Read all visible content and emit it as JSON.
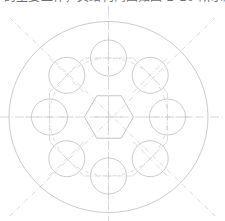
{
  "caption": {
    "text": "的主要工作，其结构简图如图 2-10 所示。",
    "note": "clipped-top-text"
  },
  "colors": {
    "outline": "#c2c2c2",
    "centerline": "#c9c9c9",
    "construction": "#cfcfcf",
    "hexagon": "#bdbdbd",
    "background": "#ffffff",
    "caption": "#6f6f6f"
  },
  "drawing": {
    "title": "flange-bolt-pattern",
    "center": {
      "x": 108.5,
      "y": 117.0
    },
    "outer_circle": {
      "cx": 108.5,
      "cy": 117.0,
      "rx": 99.5,
      "ry": 95.5
    },
    "bolt_circle": {
      "cx": 108.5,
      "cy": 117.0,
      "r": 59.0
    },
    "hexagon": {
      "cx": 109.0,
      "cy": 117.0,
      "r": 24.5,
      "orientation": "flat-top",
      "sides": 6
    },
    "hole_radius": 18.0,
    "hole_count": 8,
    "holes": [
      {
        "name": "hole-top",
        "angle": 90,
        "cx": 108.5,
        "cy": 58.0,
        "mark": "cross-orthogonal"
      },
      {
        "name": "hole-upper-right",
        "angle": 45,
        "cx": 150.2,
        "cy": 75.3,
        "mark": "cross-diagonal"
      },
      {
        "name": "hole-right",
        "angle": 0,
        "cx": 167.5,
        "cy": 117.0,
        "mark": "cross-orthogonal"
      },
      {
        "name": "hole-lower-right",
        "angle": 315,
        "cx": 150.2,
        "cy": 158.7,
        "mark": "cross-diagonal"
      },
      {
        "name": "hole-bottom",
        "angle": 270,
        "cx": 108.5,
        "cy": 176.0,
        "mark": "cross-orthogonal"
      },
      {
        "name": "hole-lower-left",
        "angle": 225,
        "cx": 66.8,
        "cy": 158.7,
        "mark": "cross-diagonal"
      },
      {
        "name": "hole-left",
        "angle": 180,
        "cx": 49.5,
        "cy": 117.0,
        "mark": "cross-orthogonal"
      },
      {
        "name": "hole-upper-left",
        "angle": 135,
        "cx": 66.8,
        "cy": 75.3,
        "mark": "cross-diagonal"
      }
    ],
    "centerlines": [
      {
        "name": "centerline-horizontal",
        "x1": 0,
        "y1": 117,
        "x2": 225,
        "y2": 117,
        "style": "center"
      },
      {
        "name": "centerline-vertical",
        "x1": 108.5,
        "y1": 6,
        "x2": 108.5,
        "y2": 221,
        "style": "center"
      },
      {
        "name": "centerline-diagonal-nwse",
        "x1": 10,
        "y1": 18,
        "x2": 215,
        "y2": 216,
        "style": "dash-dot"
      },
      {
        "name": "centerline-diagonal-nesw",
        "x1": 215,
        "y1": 18,
        "x2": 10,
        "y2": 216,
        "style": "dash-dot"
      }
    ]
  }
}
